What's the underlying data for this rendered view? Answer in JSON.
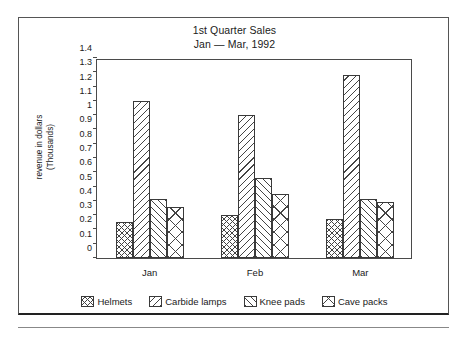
{
  "chart_data": {
    "type": "bar",
    "title": "1st Quarter Sales",
    "subtitle": "Jan — Mar, 1992",
    "xlabel": "",
    "ylabel": "revenue in dollars",
    "ylabel_line2": "(Thousands)",
    "ylim": [
      0,
      1.4
    ],
    "ytick_step": 0.1,
    "grid": false,
    "legend_position": "bottom",
    "categories": [
      "Jan",
      "Feb",
      "Mar"
    ],
    "ytick_labels": [
      "0",
      "0.1",
      "0.2",
      "0.3",
      "0.4",
      "0.5",
      "0.6",
      "0.7",
      "0.8",
      "0.9",
      "1",
      "1.1",
      "1.2",
      "1.3",
      "1.4"
    ],
    "ytick_values": [
      0,
      0.1,
      0.2,
      0.3,
      0.4,
      0.5,
      0.6,
      0.7,
      0.8,
      0.9,
      1.0,
      1.1,
      1.2,
      1.3,
      1.4
    ],
    "series": [
      {
        "name": "Helmets",
        "pattern": "crosshatch",
        "values": [
          0.25,
          0.3,
          0.27
        ]
      },
      {
        "name": "Carbide lamps",
        "pattern": "backslash",
        "values": [
          1.1,
          1.0,
          1.28
        ]
      },
      {
        "name": "Knee pads",
        "pattern": "slash",
        "values": [
          0.41,
          0.56,
          0.41
        ]
      },
      {
        "name": "Cave packs",
        "pattern": "bigx",
        "values": [
          0.36,
          0.45,
          0.39
        ]
      }
    ]
  }
}
